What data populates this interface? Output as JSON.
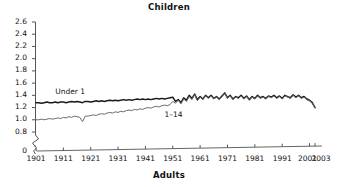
{
  "chart_data": {
    "type": "line",
    "title": "Children",
    "xlabel": "Adults",
    "ylabel": "",
    "xlim": [
      1901,
      2003
    ],
    "ylim": [
      0.8,
      2.6
    ],
    "y_axis_break": true,
    "y_break_label": "0",
    "x_axis_break": true,
    "grid": false,
    "legend": "inline-labels",
    "yticks": [
      "2.6",
      "2.4",
      "2.2",
      "2.0",
      "1.8",
      "1.6",
      "1.4",
      "1.2",
      "1.0",
      "0.8",
      "0"
    ],
    "ytick_values": [
      2.6,
      2.4,
      2.2,
      2.0,
      1.8,
      1.6,
      1.4,
      1.2,
      1.0,
      0.8,
      0
    ],
    "xticks": [
      "1901",
      "1911",
      "1921",
      "1931",
      "1941",
      "1951",
      "1961",
      "1971",
      "1981",
      "1991",
      "2001",
      "2003"
    ],
    "xtick_values": [
      1901,
      1911,
      1921,
      1931,
      1941,
      1951,
      1961,
      1971,
      1981,
      1991,
      2001,
      2003
    ],
    "series": [
      {
        "name": "Under 1",
        "color": "#1a1a1a",
        "width": 1.5,
        "label_x": 1908,
        "label_y": 1.46,
        "x": [
          1901,
          1902,
          1903,
          1904,
          1905,
          1906,
          1907,
          1908,
          1909,
          1910,
          1911,
          1912,
          1913,
          1914,
          1915,
          1916,
          1917,
          1918,
          1919,
          1920,
          1921,
          1922,
          1923,
          1924,
          1925,
          1926,
          1927,
          1928,
          1929,
          1930,
          1931,
          1932,
          1933,
          1934,
          1935,
          1936,
          1937,
          1938,
          1939,
          1940,
          1941,
          1942,
          1943,
          1944,
          1945,
          1946,
          1947,
          1948,
          1949,
          1950,
          1951,
          1952,
          1953,
          1954,
          1955,
          1956,
          1957,
          1958,
          1959,
          1960,
          1961,
          1962,
          1963,
          1964,
          1965,
          1966,
          1967,
          1968,
          1969,
          1970,
          1971,
          1972,
          1973,
          1974,
          1975,
          1976,
          1977,
          1978,
          1979,
          1980,
          1981,
          1982,
          1983,
          1984,
          1985,
          1986,
          1987,
          1988,
          1989,
          1990,
          1991,
          1992,
          1993,
          1994,
          1995,
          1996,
          1997,
          1998,
          1999,
          2000,
          2001,
          2002,
          2003
        ],
        "values": [
          1.28,
          1.28,
          1.27,
          1.28,
          1.29,
          1.28,
          1.28,
          1.29,
          1.28,
          1.29,
          1.29,
          1.28,
          1.29,
          1.3,
          1.29,
          1.3,
          1.29,
          1.28,
          1.3,
          1.3,
          1.29,
          1.3,
          1.31,
          1.3,
          1.31,
          1.3,
          1.31,
          1.32,
          1.31,
          1.32,
          1.31,
          1.32,
          1.33,
          1.32,
          1.33,
          1.32,
          1.33,
          1.34,
          1.33,
          1.34,
          1.33,
          1.34,
          1.33,
          1.34,
          1.35,
          1.34,
          1.35,
          1.34,
          1.35,
          1.36,
          1.37,
          1.3,
          1.33,
          1.28,
          1.36,
          1.32,
          1.4,
          1.35,
          1.42,
          1.33,
          1.38,
          1.34,
          1.4,
          1.36,
          1.4,
          1.35,
          1.38,
          1.34,
          1.39,
          1.44,
          1.36,
          1.4,
          1.34,
          1.38,
          1.36,
          1.4,
          1.35,
          1.39,
          1.33,
          1.38,
          1.35,
          1.4,
          1.36,
          1.38,
          1.35,
          1.39,
          1.37,
          1.4,
          1.36,
          1.39,
          1.35,
          1.4,
          1.38,
          1.36,
          1.41,
          1.37,
          1.4,
          1.36,
          1.38,
          1.34,
          1.32,
          1.28,
          1.2
        ]
      },
      {
        "name": "1–14",
        "color": "#6b6b6b",
        "width": 1.0,
        "label_x": 1948,
        "label_y": 1.08,
        "x": [
          1901,
          1902,
          1903,
          1904,
          1905,
          1906,
          1907,
          1908,
          1909,
          1910,
          1911,
          1912,
          1913,
          1914,
          1915,
          1916,
          1917,
          1918,
          1919,
          1920,
          1921,
          1922,
          1923,
          1924,
          1925,
          1926,
          1927,
          1928,
          1929,
          1930,
          1931,
          1932,
          1933,
          1934,
          1935,
          1936,
          1937,
          1938,
          1939,
          1940,
          1941,
          1942,
          1943,
          1944,
          1945,
          1946,
          1947,
          1948,
          1949,
          1950,
          1951,
          1952,
          1953,
          1954,
          1955,
          1956,
          1957,
          1958,
          1959,
          1960,
          1961,
          1962,
          1963,
          1964,
          1965,
          1966,
          1967,
          1968,
          1969,
          1970,
          1971,
          1972,
          1973,
          1974,
          1975,
          1976,
          1977,
          1978,
          1979,
          1980,
          1981,
          1982,
          1983,
          1984,
          1985,
          1986,
          1987,
          1988,
          1989,
          1990,
          1991,
          1992,
          1993,
          1994,
          1995,
          1996,
          1997,
          1998,
          1999,
          2000,
          2001,
          2002,
          2003
        ],
        "values": [
          1.0,
          1.0,
          1.01,
          1.0,
          1.01,
          1.02,
          1.01,
          1.02,
          1.03,
          1.02,
          1.04,
          1.03,
          1.05,
          1.04,
          1.06,
          1.05,
          1.04,
          0.97,
          1.06,
          1.06,
          1.07,
          1.08,
          1.07,
          1.09,
          1.1,
          1.09,
          1.11,
          1.12,
          1.11,
          1.13,
          1.12,
          1.14,
          1.13,
          1.15,
          1.16,
          1.15,
          1.17,
          1.16,
          1.18,
          1.17,
          1.19,
          1.2,
          1.19,
          1.21,
          1.22,
          1.21,
          1.23,
          1.24,
          1.23,
          1.25,
          1.3,
          1.27,
          1.32,
          1.26,
          1.34,
          1.3,
          1.38,
          1.33,
          1.41,
          1.31,
          1.37,
          1.33,
          1.39,
          1.35,
          1.39,
          1.34,
          1.37,
          1.33,
          1.38,
          1.43,
          1.35,
          1.39,
          1.33,
          1.37,
          1.35,
          1.39,
          1.34,
          1.38,
          1.32,
          1.37,
          1.34,
          1.39,
          1.35,
          1.37,
          1.34,
          1.38,
          1.36,
          1.39,
          1.35,
          1.38,
          1.34,
          1.39,
          1.37,
          1.35,
          1.4,
          1.36,
          1.39,
          1.35,
          1.37,
          1.33,
          1.31,
          1.27,
          1.19
        ]
      }
    ]
  }
}
